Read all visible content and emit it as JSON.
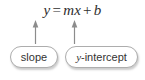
{
  "figure": {
    "kind": "annotated-equation-diagram",
    "background_color": "#ffffff"
  },
  "equation": {
    "full_text": "y = mx + b",
    "lhs": "y",
    "equals": "=",
    "slope_symbol": "m",
    "x_symbol": "x",
    "plus": "+",
    "intercept_symbol": "b",
    "text_color": "#2e2e2e"
  },
  "callouts": [
    {
      "id": "slope",
      "label": "slope",
      "label_italic_prefix": "",
      "label_rest": "slope",
      "points_to": "m",
      "border_color": "#adadad",
      "fill_color": "#ffffff"
    },
    {
      "id": "y-intercept",
      "label": "y-intercept",
      "label_italic_prefix": "y",
      "label_rest": "-intercept",
      "points_to": "b",
      "border_color": "#adadad",
      "fill_color": "#ffffff"
    }
  ],
  "arrows": [
    {
      "id": "arrow-to-m",
      "from": "slope",
      "to": "m",
      "direction": "up",
      "color": "#8c8c8c"
    },
    {
      "id": "arrow-to-b",
      "from": "y-intercept",
      "to": "b",
      "direction": "up",
      "color": "#8c8c8c"
    }
  ]
}
